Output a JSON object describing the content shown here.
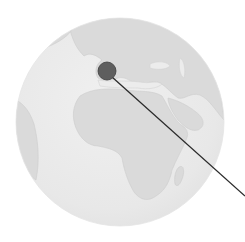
{
  "map": {
    "projection": "orthographic-globe",
    "view_center": "Africa / Europe",
    "colors": {
      "ocean": "#eeeeee",
      "land": "#dcdcdc",
      "coast": "#cfcfcf",
      "marker_fill": "#5e5e5e",
      "marker_stroke": "#3e3e3e",
      "leader_line": "#2a2a2a",
      "background": "#ffffff"
    },
    "globe": {
      "cx": 120,
      "cy": 122,
      "r": 104
    },
    "marker": {
      "name": "location-marker",
      "location": "Southern Europe (Italy/Mediterranean)",
      "cx": 107,
      "cy": 71,
      "r": 9
    },
    "leader_line": {
      "x1": 112,
      "y1": 77,
      "x2": 245,
      "y2": 196
    }
  }
}
